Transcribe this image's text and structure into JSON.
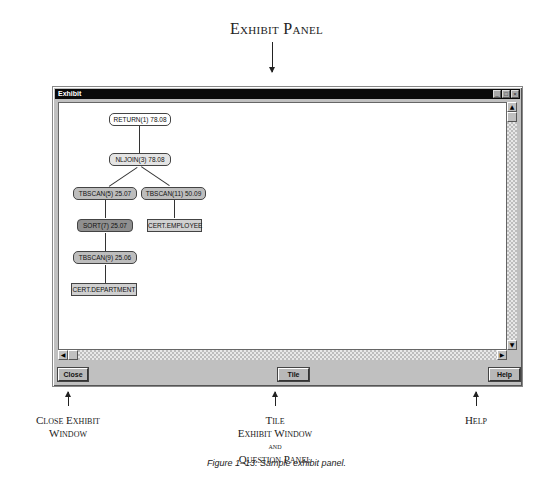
{
  "annotations": {
    "top": "Exhibit Panel",
    "close": [
      "Close Exhibit",
      "Window"
    ],
    "tile": [
      "Tile",
      "Exhibit Window",
      "and",
      "Question Panel"
    ],
    "help": "Help"
  },
  "figure_caption": "Figure 1–13: Sample exhibit panel.",
  "window": {
    "title": "Exhibit",
    "controls": {
      "minimize": "_",
      "maximize": "□",
      "close": "×"
    },
    "buttons": {
      "close": "Close",
      "tile": "Tile",
      "help": "Help"
    },
    "scroll": {
      "up": "▲",
      "down": "▼",
      "left": "◀",
      "right": "▶"
    }
  },
  "plan_tree": {
    "nodes": [
      {
        "id": "return1",
        "label": "RETURN(1) 78.08",
        "fill": "#ffffff"
      },
      {
        "id": "nljoin3",
        "label": "NLJOIN(3) 78.08",
        "fill": "#e4e4e4"
      },
      {
        "id": "tbscan5",
        "label": "TBSCAN(5) 25.07",
        "fill": "#bdbdbd"
      },
      {
        "id": "tbscan11",
        "label": "TBSCAN(11) 50.09",
        "fill": "#bdbdbd"
      },
      {
        "id": "sort7",
        "label": "SORT(7) 25.07",
        "fill": "#8f8f8f"
      },
      {
        "id": "employee",
        "label": "CERT.EMPLOYEE",
        "fill": "#d0d0d0"
      },
      {
        "id": "tbscan9",
        "label": "TBSCAN(9) 25.06",
        "fill": "#bdbdbd"
      },
      {
        "id": "department",
        "label": "CERT.DEPARTMENT",
        "fill": "#d0d0d0"
      }
    ]
  }
}
